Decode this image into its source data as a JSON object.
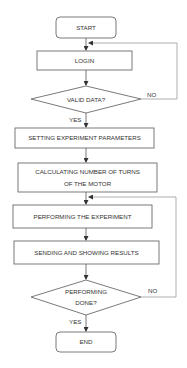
{
  "diagram": {
    "type": "flowchart",
    "nodes": {
      "start": {
        "label": "START",
        "shape": "rounded-rect"
      },
      "login": {
        "label": "LOGIN",
        "shape": "rect"
      },
      "valid_data": {
        "label": "VALID DATA?",
        "shape": "diamond"
      },
      "setting_params": {
        "label": "SETTING EXPERIMENT PARAMETERS",
        "shape": "rect"
      },
      "calculating": {
        "line1": "CALCULATING NUMBER OF TURNS",
        "line2": "OF THE MOTOR",
        "shape": "rect"
      },
      "performing_experiment": {
        "label": "PERFORMING THE EXPERIMENT",
        "shape": "rect"
      },
      "sending_results": {
        "label": "SENDING AND SHOWING RESULTS",
        "shape": "rect"
      },
      "performing_done": {
        "line1": "PERFORMING",
        "line2": "DONE?",
        "shape": "diamond"
      },
      "end": {
        "label": "END",
        "shape": "rounded-rect"
      }
    },
    "edge_labels": {
      "valid_no": "NO",
      "valid_yes": "YES",
      "done_no": "NO",
      "done_yes": "YES"
    },
    "edges": [
      {
        "from": "start",
        "to": "login"
      },
      {
        "from": "login",
        "to": "valid_data"
      },
      {
        "from": "valid_data",
        "to": "login",
        "label": "NO"
      },
      {
        "from": "valid_data",
        "to": "setting_params",
        "label": "YES"
      },
      {
        "from": "setting_params",
        "to": "calculating"
      },
      {
        "from": "calculating",
        "to": "performing_experiment"
      },
      {
        "from": "performing_experiment",
        "to": "sending_results"
      },
      {
        "from": "sending_results",
        "to": "performing_done"
      },
      {
        "from": "performing_done",
        "to": "performing_experiment",
        "label": "NO"
      },
      {
        "from": "performing_done",
        "to": "end",
        "label": "YES"
      }
    ]
  }
}
